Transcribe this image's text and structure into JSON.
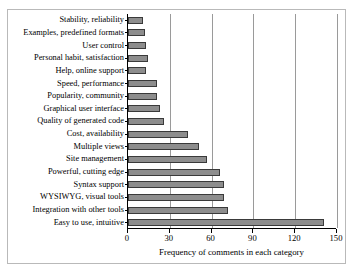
{
  "chart_data": {
    "type": "bar",
    "orientation": "horizontal",
    "title": "",
    "xlabel": "Frequency of comments in each category",
    "ylabel": "",
    "xlim": [
      0,
      150
    ],
    "xticks": [
      0,
      30,
      60,
      90,
      120,
      150
    ],
    "grid": true,
    "legend": null,
    "categories": [
      "Stability, reliability",
      "Examples, predefined formats",
      "User control",
      "Personal habit, satisfaction",
      "Help, online support",
      "Speed, performance",
      "Popularity, community",
      "Graphical user interface",
      "Quality of generated code",
      "Cost, availability",
      "Multiple views",
      "Site management",
      "Powerful, cutting edge",
      "Syntax support",
      "WYSIWYG, visual tools",
      "Integration with other tools",
      "Easy to use, intuitive"
    ],
    "values": [
      11,
      12,
      13,
      14,
      13,
      21,
      21,
      23,
      26,
      43,
      51,
      57,
      66,
      69,
      69,
      72,
      141
    ],
    "bar_color": "#8d8d8d",
    "bar_edge_color": "#3a3a3a",
    "grid_color": "#9a9a9a",
    "axis_color": "#000000",
    "background_color": "#ffffff"
  },
  "x_tick_labels": [
    "0",
    "30",
    "60",
    "90",
    "120",
    "150"
  ]
}
